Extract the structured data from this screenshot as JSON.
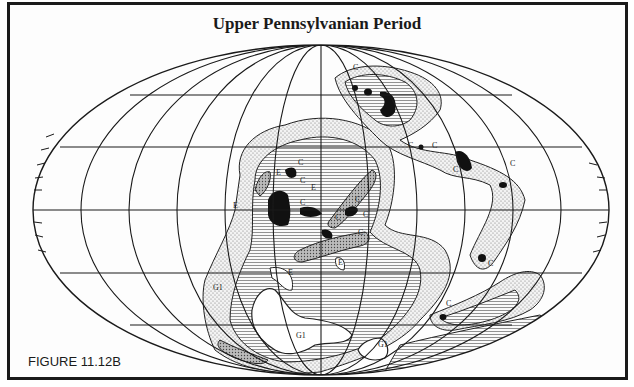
{
  "figure": {
    "title": "Upper Pennsylvanian Period",
    "caption": "FIGURE 11.12B"
  },
  "map": {
    "projection": "mollweide-like ellipse",
    "legend_symbols": {
      "C": "coal deposit (black fill)",
      "E": "evaporite",
      "G1": "glacial deposit"
    },
    "labels": [
      {
        "text": "C",
        "x": 298,
        "y": 165
      },
      {
        "text": "C",
        "x": 300,
        "y": 183
      },
      {
        "text": "C",
        "x": 300,
        "y": 205
      },
      {
        "text": "C",
        "x": 335,
        "y": 220
      },
      {
        "text": "C",
        "x": 363,
        "y": 217
      },
      {
        "text": "C",
        "x": 358,
        "y": 235
      },
      {
        "text": "C",
        "x": 355,
        "y": 202
      },
      {
        "text": "E",
        "x": 276,
        "y": 175
      },
      {
        "text": "E",
        "x": 311,
        "y": 190
      },
      {
        "text": "E",
        "x": 233,
        "y": 208
      },
      {
        "text": "C",
        "x": 353,
        "y": 70
      },
      {
        "text": "C",
        "x": 408,
        "y": 148
      },
      {
        "text": "C",
        "x": 432,
        "y": 148
      },
      {
        "text": "C",
        "x": 453,
        "y": 172
      },
      {
        "text": "C",
        "x": 510,
        "y": 166
      },
      {
        "text": "C",
        "x": 488,
        "y": 266
      },
      {
        "text": "C",
        "x": 446,
        "y": 306
      },
      {
        "text": "E",
        "x": 288,
        "y": 275
      },
      {
        "text": "E",
        "x": 338,
        "y": 265
      },
      {
        "text": "G1",
        "x": 213,
        "y": 290
      },
      {
        "text": "G1",
        "x": 296,
        "y": 338
      },
      {
        "text": "G1",
        "x": 378,
        "y": 347
      }
    ],
    "colors": {
      "ink": "#1a1a1a",
      "paper": "#fdfdfd",
      "stipple": "#9a9a9a"
    }
  }
}
